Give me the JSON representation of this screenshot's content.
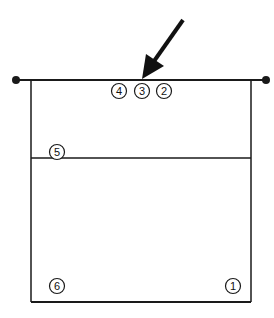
{
  "diagram": {
    "colors": {
      "line": "#1a1a1a",
      "background": "#ffffff"
    },
    "players": [
      {
        "id": "p4",
        "label": "4",
        "zone": "front-row"
      },
      {
        "id": "p3",
        "label": "3",
        "zone": "front-row"
      },
      {
        "id": "p2",
        "label": "2",
        "zone": "front-row"
      },
      {
        "id": "p5",
        "label": "5",
        "zone": "attack-line-left"
      },
      {
        "id": "p6",
        "label": "6",
        "zone": "back-row-left"
      },
      {
        "id": "p1",
        "label": "1",
        "zone": "back-row-right"
      }
    ],
    "arrow": {
      "meaning": "ball direction",
      "target": "net-center"
    }
  }
}
